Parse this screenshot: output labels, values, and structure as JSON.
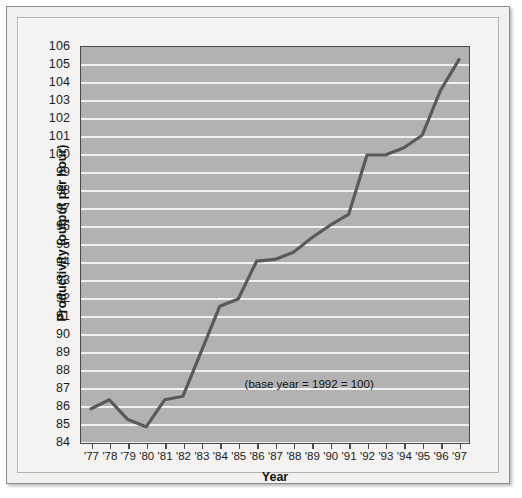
{
  "chart_data": {
    "type": "line",
    "title": "",
    "xlabel": "Year",
    "ylabel": "Productivity (output per hour)",
    "categories": [
      "'77",
      "'78",
      "'79",
      "'80",
      "'81",
      "'82",
      "'83",
      "'84",
      "'85",
      "'86",
      "'87",
      "'88",
      "'89",
      "'90",
      "'91",
      "'92",
      "'93",
      "'94",
      "'95",
      "'96",
      "'97"
    ],
    "values": [
      85.9,
      86.4,
      85.3,
      84.9,
      86.4,
      86.6,
      89.1,
      91.6,
      92.0,
      94.1,
      94.2,
      94.6,
      95.4,
      96.1,
      96.7,
      100.0,
      100.0,
      100.4,
      101.1,
      103.6,
      105.3
    ],
    "ylim": [
      84,
      106
    ],
    "ytick_labels": [
      "84",
      "85",
      "86",
      "87",
      "88",
      "89",
      "90",
      "91",
      "92",
      "93",
      "94",
      "95",
      "96",
      "97",
      "98",
      "99",
      "100",
      "101",
      "102",
      "103",
      "104",
      "105",
      "106"
    ],
    "ytick_values": [
      84,
      85,
      86,
      87,
      88,
      89,
      90,
      91,
      92,
      93,
      94,
      95,
      96,
      97,
      98,
      99,
      100,
      101,
      102,
      103,
      104,
      105,
      106
    ],
    "grid": true,
    "legend": "none",
    "annotations": [
      {
        "text": "(base year = 1992 = 100)",
        "x": "'86",
        "y": 87.2
      }
    ],
    "colors": {
      "plot_background": "#b2b2b2",
      "gridline": "#f0f0f0",
      "line": "#5a5a5a",
      "axis": "#4a4a4a",
      "figure_background": "#f2f1ef",
      "text": "#1b1b1b"
    }
  }
}
